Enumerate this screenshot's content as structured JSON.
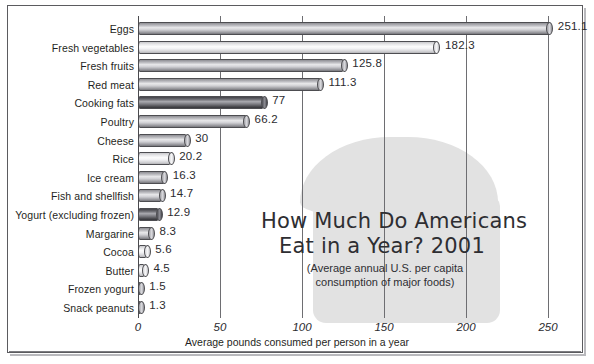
{
  "chart_data": {
    "type": "bar",
    "orientation": "horizontal",
    "title_line1": "How Much Do Americans",
    "title_line2": "Eat in a Year? 2001",
    "subtitle_line1": "(Average annual U.S. per capita",
    "subtitle_line2": "consumption of major foods)",
    "xlabel": "Average pounds consumed per person in a year",
    "ylabel": "",
    "xlim": [
      0,
      260
    ],
    "xticks": [
      "0",
      "50",
      "100",
      "150",
      "200",
      "250"
    ],
    "xtick_values": [
      0,
      50,
      100,
      150,
      200,
      250
    ],
    "grid": true,
    "legend": "none",
    "categories": [
      "Eggs",
      "Fresh vegetables",
      "Fresh fruits",
      "Red meat",
      "Cooking fats",
      "Poultry",
      "Cheese",
      "Rice",
      "Ice cream",
      "Fish and shellfish",
      "Yogurt (excluding frozen)",
      "Margarine",
      "Cocoa",
      "Butter",
      "Frozen yogurt",
      "Snack peanuts"
    ],
    "values": [
      251.1,
      182.3,
      125.8,
      111.3,
      77,
      66.2,
      30,
      20.2,
      16.3,
      14.7,
      12.9,
      8.3,
      5.6,
      4.5,
      1.5,
      1.3
    ],
    "value_labels": [
      "251.1",
      "182.3",
      "125.8",
      "111.3",
      "77",
      "66.2",
      "30",
      "20.2",
      "16.3",
      "14.7",
      "12.9",
      "8.3",
      "5.6",
      "4.5",
      "1.5",
      "1.3"
    ],
    "bar_shades": [
      "mid",
      "light",
      "mid",
      "mid",
      "dark",
      "mid",
      "mid",
      "light",
      "mid",
      "mid",
      "dark",
      "mid",
      "light",
      "light",
      "mid",
      "mid"
    ],
    "units": "pounds"
  },
  "colors": {
    "background": "#ffffff",
    "frame": "#5b5b5f",
    "gridline": "#6e6e72",
    "text": "#1f1f23",
    "watermark": "#e2e2e2",
    "bar_outline": "#4d4d51"
  },
  "watermark": {
    "name": "bread-loaf-silhouette"
  }
}
